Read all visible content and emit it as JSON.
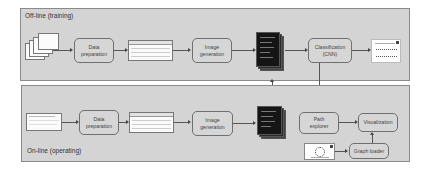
{
  "offline_panel": {
    "title": "Off-line (training)",
    "nodes": {
      "data_preparation": "Data\npreparation",
      "image_generation": "Image\ngeneration",
      "classification": "Classification\n(CNN)"
    }
  },
  "online_panel": {
    "title": "On-line (operating)",
    "nodes": {
      "data_preparation": "Data\npreparation",
      "image_generation": "Image\ngeneration",
      "path_explorer": "Path\nexplorer",
      "visualization": "Visualization",
      "graph_loader": "Graph loader"
    }
  },
  "icons": {
    "raw_documents": "stacked-documents-icon",
    "tabular_data": "table-icon",
    "generated_images": "black-image-stack-icon",
    "classification_result": "result-chart-icon",
    "graph_image": "graph-icon"
  },
  "colors": {
    "panel_bg": "#d4d4d4",
    "panel_border": "#8a8a8a",
    "node_border": "#6f6f6f",
    "image_stack": "#151515"
  }
}
